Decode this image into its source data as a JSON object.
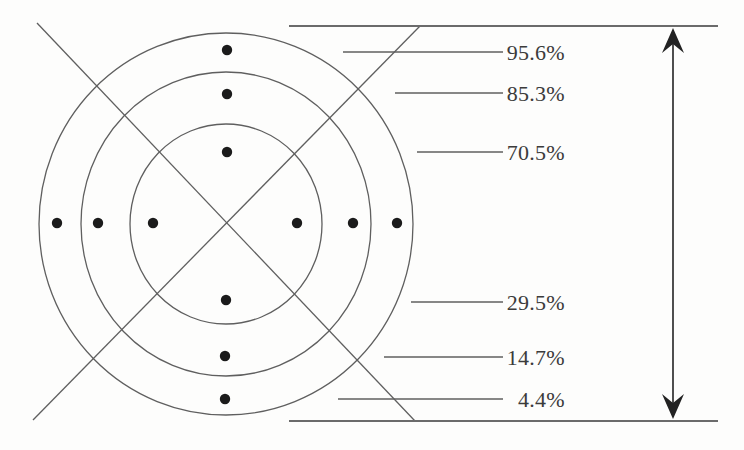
{
  "colors": {
    "background": "#fdfdfc",
    "line": "#5f5f5f",
    "bound_line": "#6b6b6b",
    "dot": "#1b1b1b",
    "arrow": "#222222",
    "text": "#3b3b3b"
  },
  "diagram": {
    "center": {
      "x": 226,
      "y": 224
    },
    "rings": [
      {
        "rx": 96,
        "ry": 100
      },
      {
        "rx": 145,
        "ry": 152
      },
      {
        "rx": 187,
        "ry": 191
      }
    ],
    "diagonals": [
      {
        "x1": 37,
        "y1": 23,
        "x2": 415,
        "y2": 421
      },
      {
        "x1": 33,
        "y1": 420,
        "x2": 420,
        "y2": 26
      }
    ],
    "bound_lines": [
      {
        "x1": 289,
        "y1": 26,
        "x2": 718,
        "y2": 26
      },
      {
        "x1": 289,
        "y1": 421,
        "x2": 718,
        "y2": 421
      }
    ],
    "dot_radius": 5.2,
    "dots": [
      {
        "x": 227,
        "y": 50
      },
      {
        "x": 227,
        "y": 94
      },
      {
        "x": 227,
        "y": 152
      },
      {
        "x": 226,
        "y": 300
      },
      {
        "x": 225,
        "y": 356
      },
      {
        "x": 225,
        "y": 399
      },
      {
        "x": 57,
        "y": 223
      },
      {
        "x": 98,
        "y": 223
      },
      {
        "x": 153,
        "y": 223
      },
      {
        "x": 297,
        "y": 223
      },
      {
        "x": 353,
        "y": 223
      },
      {
        "x": 397,
        "y": 223
      }
    ],
    "labels": [
      {
        "text": "95.6%",
        "leader": {
          "x1": 343,
          "x2": 503,
          "y": 52
        }
      },
      {
        "text": "85.3%",
        "leader": {
          "x1": 395,
          "x2": 503,
          "y": 93
        }
      },
      {
        "text": "70.5%",
        "leader": {
          "x1": 417,
          "x2": 503,
          "y": 152
        }
      },
      {
        "text": "29.5%",
        "leader": {
          "x1": 411,
          "x2": 503,
          "y": 302
        }
      },
      {
        "text": "14.7%",
        "leader": {
          "x1": 384,
          "x2": 503,
          "y": 357
        }
      },
      {
        "text": "4.4%",
        "leader": {
          "x1": 338,
          "x2": 503,
          "y": 399
        }
      }
    ],
    "label_anchor_x": 565,
    "range_arrow": {
      "x": 673,
      "y_top_tip": 28,
      "y_bottom_tip": 419
    }
  }
}
